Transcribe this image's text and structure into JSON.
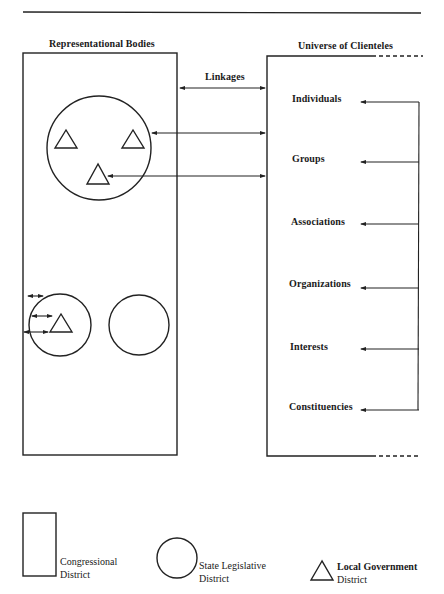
{
  "diagram": {
    "left_panel_title": "Representational Bodies",
    "right_panel_title": "Universe of Clienteles",
    "linkages_label": "Linkages",
    "clienteles": [
      {
        "label": "Individuals"
      },
      {
        "label": "Groups"
      },
      {
        "label": "Associations"
      },
      {
        "label": "Organizations"
      },
      {
        "label": "Interests"
      },
      {
        "label": "Constituencies"
      }
    ]
  },
  "legend": {
    "congressional": {
      "line1": "Congressional",
      "line2": "District"
    },
    "state": {
      "line1": "State Legislative",
      "line2": "District"
    },
    "local": {
      "line1": "Local Government",
      "line2": "District"
    }
  }
}
